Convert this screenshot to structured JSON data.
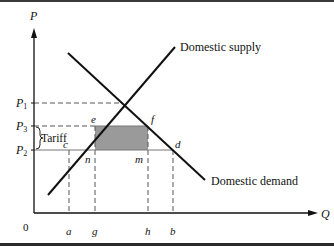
{
  "diagram": {
    "axes": {
      "y_label": "P",
      "x_label": "Q",
      "origin_label": "0"
    },
    "price_levels": [
      {
        "id": "P1",
        "label": "P",
        "sub": "1"
      },
      {
        "id": "P3",
        "label": "P",
        "sub": "3"
      },
      {
        "id": "P2",
        "label": "P",
        "sub": "2"
      }
    ],
    "quantity_ticks": [
      "a",
      "g",
      "h",
      "b"
    ],
    "curves": {
      "supply_label": "Domestic supply",
      "demand_label": "Domestic demand"
    },
    "points": {
      "e": "e",
      "f": "f",
      "c": "c",
      "d": "d",
      "n": "n",
      "m": "m"
    },
    "tariff_label": "Tariff",
    "colors": {
      "line": "#111111",
      "dashed": "#555555",
      "shaded_area": "#9a9a9a",
      "frame": "#333333"
    }
  }
}
